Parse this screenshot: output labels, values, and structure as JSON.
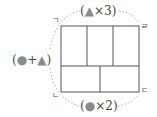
{
  "diagram": {
    "type": "rectangle-partition",
    "rectangle": {
      "left": 61,
      "top": 26,
      "right": 139,
      "bottom": 92,
      "stroke": "#555555"
    },
    "dividers": {
      "horizontal_y": 66,
      "top_row_verticals_x": [
        87,
        113
      ],
      "bottom_row_verticals_x": [
        100
      ]
    },
    "corners": {
      "top_left": "ㄱ",
      "top_right": "ㄹ",
      "bottom_left": "ㄴ",
      "bottom_right": "ㄷ"
    },
    "labels": {
      "top": {
        "open": "(",
        "shape": "▲",
        "op": "×",
        "value": "3",
        "close": ")"
      },
      "left": {
        "open": "(",
        "shape1": "●",
        "op": "+",
        "shape2": "▲",
        "close": ")"
      },
      "bottom": {
        "open": "(",
        "shape": "●",
        "op": "×",
        "value": "2",
        "close": ")"
      }
    },
    "colors": {
      "shape": "#8a8a8a",
      "line": "#555555",
      "dotted": "#aaaaaa",
      "text": "#444444"
    }
  }
}
